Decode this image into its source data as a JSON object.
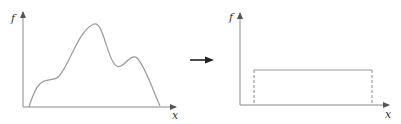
{
  "diagram": {
    "colors": {
      "axis": "#8a8a8a",
      "curve": "#9a9a9a",
      "arrow": "#222222",
      "label": "#333333"
    },
    "left_plot": {
      "y_label": "f",
      "x_label": "x",
      "shape": "multimodal-curve"
    },
    "transform_arrow": {
      "icon": "right-arrow-icon"
    },
    "right_plot": {
      "y_label": "f",
      "x_label": "x",
      "shape": "uniform-rectangle",
      "edges": "dashed-verticals"
    }
  }
}
